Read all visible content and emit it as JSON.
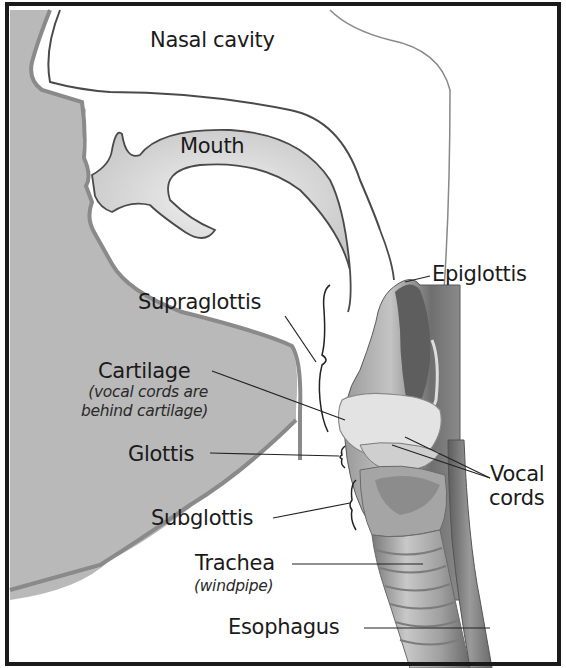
{
  "diagram": {
    "colors": {
      "border": "#1a1a1a",
      "face_shade": "#b8b8b8",
      "face_outline": "#8a8a8a",
      "cavity_fill": "#e6e6e6",
      "tissue_dark": "#6e6e6e",
      "tissue_mid": "#a9a9a9",
      "tissue_light": "#dcdcdc",
      "text": "#1a1a1a"
    },
    "labels": {
      "nasal_cavity": "Nasal cavity",
      "mouth": "Mouth",
      "epiglottis": "Epiglottis",
      "supraglottis": "Supraglottis",
      "cartilage": "Cartilage",
      "cartilage_note_1": "(vocal cords are",
      "cartilage_note_2": "behind cartilage)",
      "glottis": "Glottis",
      "vocal": "Vocal",
      "cords": "cords",
      "subglottis": "Subglottis",
      "trachea": "Trachea",
      "trachea_note": "(windpipe)",
      "esophagus": "Esophagus"
    }
  }
}
